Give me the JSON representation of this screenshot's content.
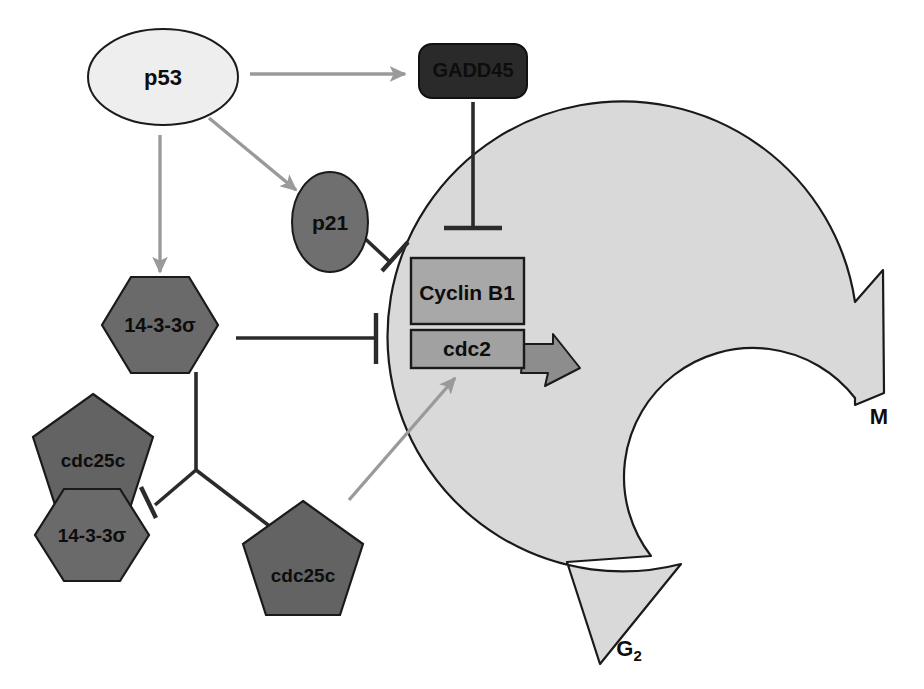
{
  "diagram": {
    "background_color": "#ffffff",
    "nodes": {
      "p53": {
        "label": "p53",
        "shape": "ellipse",
        "fill": "#eeeeee",
        "stroke": "#1a1a1a",
        "cx": 163,
        "cy": 77,
        "rx": 75,
        "ry": 48,
        "font_size": 22
      },
      "gadd45": {
        "label": "GADD45",
        "shape": "rounded-rect",
        "fill": "#2a2a2a",
        "stroke": "#111111",
        "x": 419,
        "y": 44,
        "width": 108,
        "height": 54,
        "radius": 12,
        "font_size": 20,
        "text_color": "#000000"
      },
      "p21": {
        "label": "p21",
        "shape": "ellipse",
        "fill": "#6f6f6f",
        "stroke": "#1a1a1a",
        "cx": 330,
        "cy": 222,
        "rx": 38,
        "ry": 50,
        "font_size": 21
      },
      "cyclin_b1": {
        "label": "Cyclin B1",
        "shape": "rect",
        "fill": "#a8a8a8",
        "stroke": "#1a1a1a",
        "x": 411,
        "y": 258,
        "width": 113,
        "height": 66,
        "font_size": 21
      },
      "cdc2": {
        "label": "cdc2",
        "shape": "rect",
        "fill": "#a1a1a1",
        "stroke": "#1a1a1a",
        "x": 411,
        "y": 330,
        "width": 113,
        "height": 38,
        "font_size": 21
      },
      "sigma_free": {
        "label": "14-3-3",
        "suffix": "σ",
        "shape": "hexagon",
        "fill": "#6a6a6a",
        "stroke": "#1a1a1a",
        "cx": 160,
        "cy": 325,
        "rx": 58,
        "ry": 48,
        "font_size": 20
      },
      "cdc25c_bound": {
        "label": "cdc25c",
        "shape": "pentagon",
        "fill": "#636363",
        "stroke": "#1a1a1a",
        "cx": 93,
        "cy": 455,
        "r": 63,
        "font_size": 19
      },
      "sigma_bound": {
        "label": "14-3-3",
        "suffix": "σ",
        "shape": "hexagon",
        "fill": "#6a6a6a",
        "stroke": "#1a1a1a",
        "cx": 92,
        "cy": 535,
        "rx": 57,
        "ry": 46,
        "font_size": 19
      },
      "cdc25c_free": {
        "label": "cdc25c",
        "shape": "pentagon",
        "fill": "#636363",
        "stroke": "#1a1a1a",
        "cx": 303,
        "cy": 562,
        "r": 63,
        "font_size": 19
      }
    },
    "cycle_arrow": {
      "fill": "#d9d9d9",
      "stroke": "#1a1a1a",
      "phase_start_label": "G",
      "phase_start_sub": "2",
      "phase_end_label": "M",
      "start_label_x": 629,
      "start_label_y": 650,
      "end_label_x": 879,
      "end_label_y": 418,
      "font_size": 22
    },
    "activation_arrows": [
      {
        "name": "p53-to-gadd45",
        "from": "p53",
        "to": "gadd45",
        "color": "#9a9a9a",
        "type": "activation"
      },
      {
        "name": "p53-to-p21",
        "from": "p53",
        "to": "p21",
        "color": "#9a9a9a",
        "type": "activation"
      },
      {
        "name": "p53-to-14-3-3-sigma",
        "from": "p53",
        "to": "sigma_free",
        "color": "#9a9a9a",
        "type": "activation"
      },
      {
        "name": "cdc25c-to-cdc2",
        "from": "cdc25c_free",
        "to": "cdc2",
        "color": "#9a9a9a",
        "type": "activation"
      }
    ],
    "inhibition_arrows": [
      {
        "name": "gadd45-inhibits-cyclin-b1",
        "from": "gadd45",
        "to": "cyclin_b1",
        "color": "#2b2b2b",
        "type": "inhibition"
      },
      {
        "name": "p21-inhibits-cyclin-b1",
        "from": "p21",
        "to": "cyclin_b1",
        "color": "#2b2b2b",
        "type": "inhibition"
      },
      {
        "name": "14-3-3-sigma-inhibits-cyclin-b1",
        "from": "sigma_free",
        "to": "cyclin_b1",
        "color": "#2b2b2b",
        "type": "inhibition"
      },
      {
        "name": "14-3-3-sigma-inhibits-cdc25c-complex",
        "from": "sigma_free",
        "to": "cdc25c_bound",
        "color": "#2b2b2b",
        "type": "inhibition"
      }
    ],
    "sequestration_link": {
      "name": "14-3-3-sigma-sequesters-cdc25c",
      "from": "sigma_free",
      "to": "cdc25c_free",
      "color": "#2b2b2b",
      "type": "plain-line"
    },
    "transition_arrow": {
      "name": "cdc2-drives-g2-m-transition",
      "fill": "#8d8d8d",
      "stroke": "#1a1a1a"
    }
  }
}
